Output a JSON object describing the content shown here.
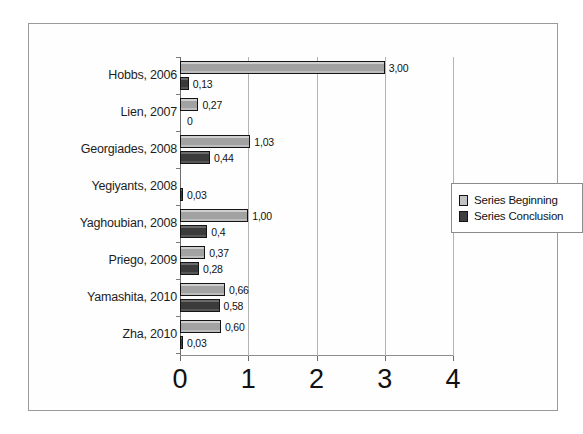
{
  "chart_data": {
    "type": "bar",
    "orientation": "horizontal",
    "title": "",
    "xlabel": "",
    "ylabel": "",
    "xlim": [
      0,
      4
    ],
    "xticks": [
      "0",
      "1",
      "2",
      "3",
      "4"
    ],
    "grid": true,
    "legend_position": "right",
    "categories": [
      "Hobbs, 2006",
      "Lien, 2007",
      "Georgiades, 2008",
      "Yegiyants, 2008",
      "Yaghoubian, 2008",
      "Priego, 2009",
      "Yamashita, 2010",
      "Zha, 2010"
    ],
    "series": [
      {
        "name": "Series Beginning",
        "color": "#a9a9a9",
        "values": [
          3.0,
          0.27,
          1.03,
          null,
          1.0,
          0.37,
          0.66,
          0.6
        ],
        "labels": [
          "3,00",
          "0,27",
          "1,03",
          "",
          "1,00",
          "0,37",
          "0,66",
          "0,60"
        ]
      },
      {
        "name": "Series Conclusion",
        "color": "#3f3f3f",
        "values": [
          0.13,
          0,
          0.44,
          0.03,
          0.4,
          0.28,
          0.58,
          0.03
        ],
        "labels": [
          "0,13",
          "0",
          "0,44",
          "0,03",
          "0,4",
          "0,28",
          "0,58",
          "0,03"
        ]
      }
    ]
  },
  "legend": {
    "items": [
      {
        "label": "Series Beginning"
      },
      {
        "label": "Series Conclusion"
      }
    ]
  }
}
